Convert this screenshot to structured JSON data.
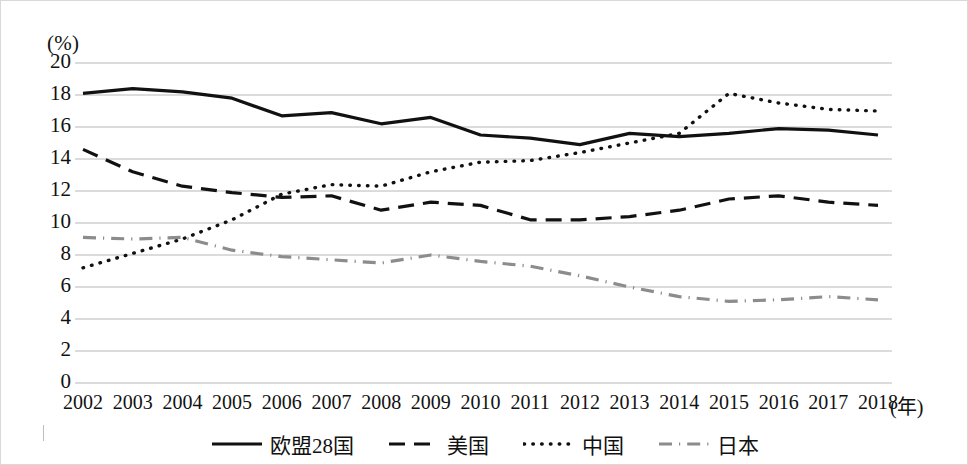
{
  "chart_data": {
    "type": "line",
    "title": "",
    "subtitle": "",
    "ylabel": "(%)",
    "xlabel": "(年)",
    "x": [
      2002,
      2003,
      2004,
      2005,
      2006,
      2007,
      2008,
      2009,
      2010,
      2011,
      2012,
      2013,
      2014,
      2015,
      2016,
      2017,
      2018
    ],
    "xtick_labels": [
      "2002",
      "2003",
      "2004",
      "2005",
      "2006",
      "2007",
      "2008",
      "2009",
      "2010",
      "2011",
      "2012",
      "2013",
      "2014",
      "2015",
      "2016",
      "2017",
      "2018"
    ],
    "ytick_labels": [
      "0",
      "2",
      "4",
      "6",
      "8",
      "10",
      "12",
      "14",
      "16",
      "18",
      "20"
    ],
    "ytick_values": [
      0,
      2,
      4,
      6,
      8,
      10,
      12,
      14,
      16,
      18,
      20
    ],
    "ylim": [
      0,
      20
    ],
    "grid": true,
    "grid_axis": "y",
    "legend_position": "bottom-center",
    "series": [
      {
        "name": "欧盟28国",
        "style": "solid",
        "color": "#111111",
        "width": 3.2,
        "values": [
          18.1,
          18.4,
          18.2,
          17.8,
          16.7,
          16.9,
          16.2,
          16.6,
          15.5,
          15.3,
          14.9,
          15.6,
          15.4,
          15.6,
          15.9,
          15.8,
          15.5
        ]
      },
      {
        "name": "美国",
        "style": "dashed",
        "color": "#111111",
        "width": 3.2,
        "values": [
          14.6,
          13.2,
          12.3,
          11.9,
          11.6,
          11.7,
          10.8,
          11.3,
          11.1,
          10.2,
          10.2,
          10.4,
          10.8,
          11.5,
          11.7,
          11.3,
          11.1
        ]
      },
      {
        "name": "中国",
        "style": "dotted",
        "color": "#111111",
        "width": 3.4,
        "values": [
          7.2,
          8.1,
          9.0,
          10.2,
          11.8,
          12.4,
          12.3,
          13.2,
          13.8,
          13.9,
          14.4,
          15.0,
          15.6,
          18.1,
          17.5,
          17.1,
          17.0
        ]
      },
      {
        "name": "日本",
        "style": "dashdot",
        "color": "#8c8c8c",
        "width": 3.2,
        "values": [
          9.1,
          9.0,
          9.1,
          8.3,
          7.9,
          7.7,
          7.5,
          8.0,
          7.6,
          7.3,
          6.7,
          6.0,
          5.4,
          5.1,
          5.2,
          5.4,
          5.2
        ]
      }
    ]
  },
  "axis": {
    "y_unit": "(%)",
    "x_unit": "(年)"
  }
}
